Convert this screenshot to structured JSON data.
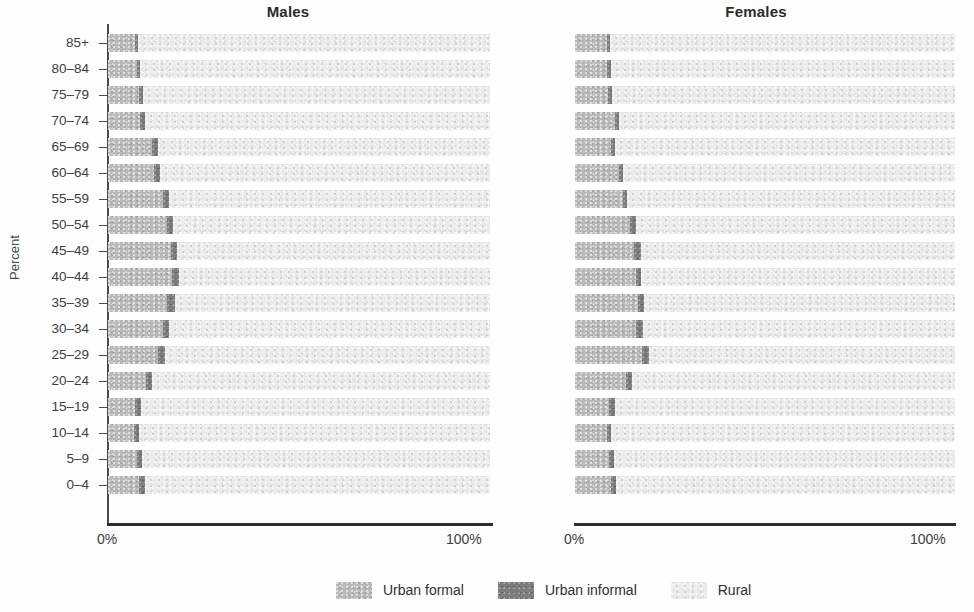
{
  "axis": {
    "ylabel": "Percent",
    "xticks": [
      "0%",
      "100%"
    ],
    "age_groups": [
      "85+",
      "80–84",
      "75–79",
      "70–74",
      "65–69",
      "60–64",
      "55–59",
      "50–54",
      "45–49",
      "40–44",
      "35–39",
      "30–34",
      "25–29",
      "20–24",
      "15–19",
      "10–14",
      "5–9",
      "0–4"
    ]
  },
  "panels": {
    "males": {
      "title": "Males",
      "xtick_left": "0%",
      "xtick_right": "100%"
    },
    "females": {
      "title": "Females",
      "xtick_left": "0%",
      "xtick_right": "100%"
    }
  },
  "legend": {
    "items": [
      {
        "label": "Urban formal",
        "color": "#b9b9b9"
      },
      {
        "label": "Urban informal",
        "color": "#7d7d7d"
      },
      {
        "label": "Rural",
        "color": "#ececec"
      }
    ]
  },
  "colors": {
    "urban_formal": "#b9b9b9",
    "urban_informal": "#7d7d7d",
    "rural": "#ececec",
    "axis": "#2e2e2e",
    "text": "#3a3a3a"
  },
  "chart_data": {
    "type": "bar",
    "subtitle": "",
    "orientation": "horizontal",
    "stacked": true,
    "stack_total": 100,
    "xlabel": "",
    "ylabel": "Percent",
    "xlim": [
      0,
      100
    ],
    "xticks": [
      0,
      100
    ],
    "xticklabels": [
      "0%",
      "100%"
    ],
    "grid": false,
    "legend_position": "bottom-center",
    "categories": [
      "85+",
      "80–84",
      "75–79",
      "70–74",
      "65–69",
      "60–64",
      "55–59",
      "50–54",
      "45–49",
      "40–44",
      "35–39",
      "30–34",
      "25–29",
      "20–24",
      "15–19",
      "10–14",
      "5–9",
      "0–4"
    ],
    "series_names": [
      "Urban formal",
      "Urban informal",
      "Rural"
    ],
    "panels": [
      {
        "name": "Males",
        "series": [
          {
            "name": "Urban formal",
            "values": [
              7.0,
              7.5,
              8.0,
              8.5,
              11.5,
              12.0,
              14.5,
              15.5,
              16.5,
              16.8,
              15.5,
              14.5,
              13.0,
              10.0,
              7.0,
              6.8,
              7.5,
              8.0
            ]
          },
          {
            "name": "Urban informal",
            "values": [
              0.9,
              1.0,
              1.2,
              1.1,
              1.7,
              1.6,
              1.4,
              1.5,
              1.6,
              1.7,
              2.1,
              1.5,
              1.9,
              1.5,
              1.6,
              1.2,
              1.3,
              1.6
            ]
          },
          {
            "name": "Rural",
            "values": [
              92.1,
              91.5,
              90.8,
              90.4,
              86.8,
              86.4,
              84.1,
              83.0,
              81.9,
              81.5,
              82.4,
              84.0,
              85.1,
              88.5,
              91.4,
              92.0,
              91.2,
              90.4
            ]
          }
        ]
      },
      {
        "name": "Females",
        "series": [
          {
            "name": "Urban formal",
            "values": [
              8.5,
              8.5,
              8.8,
              10.5,
              9.5,
              11.5,
              12.5,
              14.5,
              15.5,
              16.0,
              16.5,
              16.0,
              17.5,
              13.5,
              9.0,
              8.5,
              9.0,
              9.5
            ]
          },
          {
            "name": "Urban informal",
            "values": [
              0.8,
              0.9,
              1.0,
              1.0,
              1.0,
              1.2,
              1.1,
              1.6,
              1.8,
              1.5,
              1.6,
              1.9,
              1.9,
              1.4,
              1.5,
              1.1,
              1.3,
              1.2
            ]
          },
          {
            "name": "Rural",
            "values": [
              90.7,
              90.6,
              90.2,
              88.5,
              89.5,
              87.3,
              86.4,
              83.9,
              82.7,
              82.5,
              81.9,
              82.1,
              80.6,
              85.1,
              89.5,
              90.4,
              89.7,
              89.3
            ]
          }
        ]
      }
    ]
  }
}
